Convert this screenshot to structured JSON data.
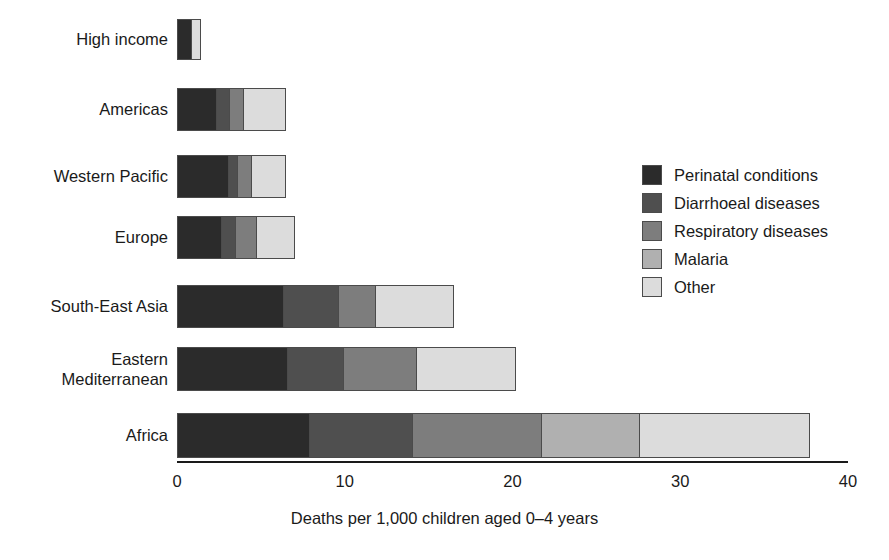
{
  "chart_data": {
    "type": "bar",
    "orientation": "horizontal",
    "stacked": true,
    "title": "",
    "xlabel": "Deaths per 1,000 children aged 0–4 years",
    "ylabel": "",
    "xlim": [
      0,
      40
    ],
    "xticks": [
      0,
      10,
      20,
      30,
      40
    ],
    "xtick_labels": [
      "0",
      "10",
      "20",
      "30",
      "40"
    ],
    "grid": false,
    "legend_position": "right",
    "categories": [
      "High income",
      "Americas",
      "Western Pacific",
      "Europe",
      "South-East Asia",
      "Eastern\nMediterranean",
      "Africa"
    ],
    "series": [
      {
        "name": "Perinatal conditions",
        "color": "#2b2b2b",
        "values": [
          0.9,
          2.4,
          3.1,
          2.7,
          6.4,
          6.6,
          7.9
        ]
      },
      {
        "name": "Diarrhoeal diseases",
        "color": "#4f4f4f",
        "values": [
          0.0,
          0.8,
          0.6,
          0.9,
          3.3,
          3.4,
          6.2
        ]
      },
      {
        "name": "Respiratory diseases",
        "color": "#7d7d7d",
        "values": [
          0.0,
          0.9,
          0.9,
          1.3,
          2.3,
          4.4,
          7.8
        ]
      },
      {
        "name": "Malaria",
        "color": "#b0b0b0",
        "values": [
          0.0,
          0.0,
          0.0,
          0.0,
          0.0,
          0.0,
          5.9
        ]
      },
      {
        "name": "Other",
        "color": "#dcdcdc",
        "values": [
          0.6,
          2.6,
          2.1,
          2.3,
          4.7,
          6.0,
          10.2
        ]
      }
    ],
    "totals": [
      1.5,
      6.7,
      6.7,
      7.2,
      16.7,
      20.4,
      38.0
    ]
  },
  "legend": {
    "entries": [
      {
        "label": "Perinatal conditions",
        "color": "#2b2b2b"
      },
      {
        "label": "Diarrhoeal diseases",
        "color": "#4f4f4f"
      },
      {
        "label": "Respiratory diseases",
        "color": "#7d7d7d"
      },
      {
        "label": "Malaria",
        "color": "#b0b0b0"
      },
      {
        "label": "Other",
        "color": "#dcdcdc"
      }
    ]
  },
  "axis": {
    "title": "Deaths per 1,000 children aged 0–4 years",
    "ticks": [
      "0",
      "10",
      "20",
      "30",
      "40"
    ]
  }
}
